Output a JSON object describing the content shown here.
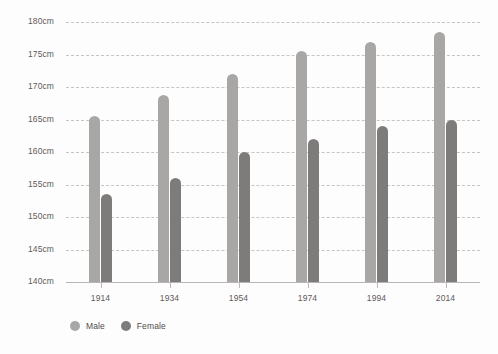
{
  "chart_data": {
    "type": "bar",
    "title": "",
    "subtitle": "",
    "xlabel": "",
    "ylabel": "",
    "categories": [
      "1914",
      "1934",
      "1954",
      "1974",
      "1994",
      "2014"
    ],
    "series": [
      {
        "name": "Male",
        "color": "#a9a7a6",
        "values": [
          165.5,
          168.8,
          172.0,
          175.5,
          177.0,
          178.5
        ]
      },
      {
        "name": "Female",
        "color": "#7e7c7b",
        "values": [
          153.5,
          156.0,
          160.0,
          162.0,
          164.0,
          165.0
        ]
      }
    ],
    "ylim": [
      140,
      180
    ],
    "ytick_values": [
      180,
      175,
      170,
      165,
      160,
      155,
      150,
      145,
      140
    ],
    "ytick_labels": [
      "180cm",
      "175cm",
      "170cm",
      "165cm",
      "160cm",
      "155cm",
      "150cm",
      "145cm",
      "140cm"
    ],
    "unit": "cm",
    "grid": true,
    "grid_style": "dashed-horizontal",
    "legend_position": "bottom-left",
    "legend": [
      {
        "label": "Male",
        "color": "#a9a7a6",
        "marker": "circle"
      },
      {
        "label": "Female",
        "color": "#7e7c7b",
        "marker": "circle"
      }
    ]
  },
  "colors": {
    "background": "#fdfdfd",
    "grid": "#c9c4c4",
    "axis": "#b9b5b5",
    "tick_text": "#5d5a5a",
    "legend_text": "#4e4b4b",
    "male": "#a9a7a6",
    "female": "#7e7c7b"
  }
}
